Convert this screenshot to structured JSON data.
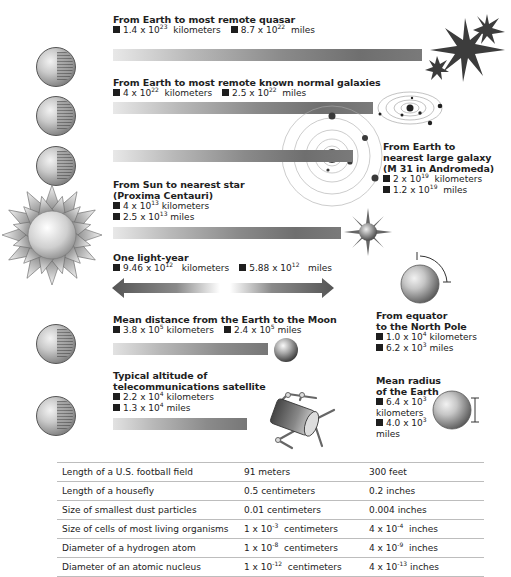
{
  "sections": {
    "quasar": {
      "title": "From Earth to most remote quasar",
      "km_base": "1.4 x 10",
      "km_exp": "23",
      "km_unit": "kilometers",
      "mi_base": "8.7 x 10",
      "mi_exp": "22",
      "mi_unit": "miles"
    },
    "galaxies": {
      "title": "From Earth to most remote known normal galaxies",
      "km_base": "4 x 10",
      "km_exp": "22",
      "km_unit": "kilometers",
      "mi_base": "2.5 x 10",
      "mi_exp": "22",
      "mi_unit": "miles"
    },
    "andromeda": {
      "title_1": "From Earth to",
      "title_2": "nearest large galaxy",
      "title_3": "(M 31 in Andromeda)",
      "km_base": "2 x 10",
      "km_exp": "19",
      "km_unit": "kilometers",
      "mi_base": "1.2 x 10",
      "mi_exp": "19",
      "mi_unit": "miles"
    },
    "proxima": {
      "title_1": "From Sun to nearest star",
      "title_2": "(Proxima Centauri)",
      "km_base": "4 x 10",
      "km_exp": "13",
      "km_unit": "kilometers",
      "mi_base": "2.5 x 10",
      "mi_exp": "13",
      "mi_unit": "miles"
    },
    "light_year": {
      "title": "One light-year",
      "km_base": "9.46 x 10",
      "km_exp": "12",
      "km_unit": "kilometers",
      "mi_base": "5.88 x 10",
      "mi_exp": "12",
      "mi_unit": "miles"
    },
    "equator_pole": {
      "title_1": "From equator",
      "title_2": "to the North Pole",
      "km_base": "1.0 x 10",
      "km_exp": "4",
      "km_unit": "kilometers",
      "mi_base": "6.2 x 10",
      "mi_exp": "3",
      "mi_unit": "miles"
    },
    "moon": {
      "title": "Mean distance from the Earth to the Moon",
      "km_base": "3.8 x 10",
      "km_exp": "5",
      "km_unit": "kilometers",
      "mi_base": "2.4 x 10",
      "mi_exp": "5",
      "mi_unit": "miles"
    },
    "satellite": {
      "title_1": "Typical altitude of",
      "title_2": "telecommunications satellite",
      "km_base": "2.2 x 10",
      "km_exp": "4",
      "km_unit": "kilometers",
      "mi_base": "1.3 x 10",
      "mi_exp": "4",
      "mi_unit": "miles"
    },
    "earth_radius": {
      "title_1": "Mean radius",
      "title_2": "of the Earth",
      "km_base": "6.4 x 10",
      "km_exp": "3",
      "km_unit": "kilometers",
      "mi_base": "4.0 x 10",
      "mi_exp": "3",
      "mi_unit": "miles"
    }
  },
  "icons": [
    "earth-globe-icon",
    "quasar-star-icon",
    "galaxy-orbit-icon",
    "sun-icon",
    "star-icon",
    "moon-icon",
    "satellite-icon",
    "double-arrow-icon"
  ],
  "table": {
    "rows": [
      {
        "item": "Length of a U.S. football field",
        "metric": "91 meters",
        "metric_exp": "",
        "metric_unit": "",
        "imperial": "300 feet",
        "imperial_exp": "",
        "imperial_unit": ""
      },
      {
        "item": "Length of a housefly",
        "metric": "0.5 centimeters",
        "metric_exp": "",
        "metric_unit": "",
        "imperial": "0.2 inches",
        "imperial_exp": "",
        "imperial_unit": ""
      },
      {
        "item": "Size of smallest dust particles",
        "metric": "0.01 centimeters",
        "metric_exp": "",
        "metric_unit": "",
        "imperial": "0.004 inches",
        "imperial_exp": "",
        "imperial_unit": ""
      },
      {
        "item": "Size of cells of most living organisms",
        "metric": "1 x 10",
        "metric_exp": "-3",
        "metric_unit": "centimeters",
        "imperial": "4 x 10",
        "imperial_exp": "-4",
        "imperial_unit": "inches"
      },
      {
        "item": "Diameter of a hydrogen atom",
        "metric": "1 x 10",
        "metric_exp": "-8",
        "metric_unit": "centimeters",
        "imperial": "4 x 10",
        "imperial_exp": "-9",
        "imperial_unit": "inches"
      },
      {
        "item": "Diameter of an atomic nucleus",
        "metric": "1 x 10",
        "metric_exp": "-12",
        "metric_unit": "centimeters",
        "imperial": "4 x 10",
        "imperial_exp": "-13",
        "imperial_unit": "inches"
      }
    ]
  }
}
